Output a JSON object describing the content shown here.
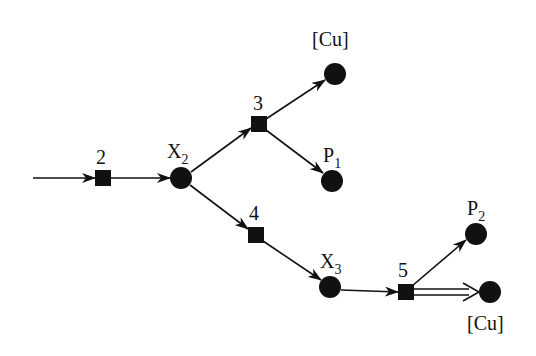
{
  "diagram": {
    "type": "reaction-network",
    "colors": {
      "ink": "#111111",
      "background": "#ffffff"
    },
    "nodes": [
      {
        "id": "X2",
        "shape": "circle",
        "x": 181,
        "y": 178,
        "label": "X",
        "sub": "2",
        "label_x": 167,
        "label_y": 158
      },
      {
        "id": "Cu_top",
        "shape": "circle",
        "x": 335,
        "y": 74,
        "label": "[Cu]",
        "sub": "",
        "label_x": 312,
        "label_y": 46
      },
      {
        "id": "P1",
        "shape": "circle",
        "x": 332,
        "y": 181,
        "label": "P",
        "sub": "1",
        "label_x": 323,
        "label_y": 162
      },
      {
        "id": "X3",
        "shape": "circle",
        "x": 330,
        "y": 287,
        "label": "X",
        "sub": "3",
        "label_x": 320,
        "label_y": 268
      },
      {
        "id": "P2",
        "shape": "circle",
        "x": 476,
        "y": 234,
        "label": "P",
        "sub": "2",
        "label_x": 467,
        "label_y": 215
      },
      {
        "id": "Cu_bot",
        "shape": "circle",
        "x": 490,
        "y": 292,
        "label": "[Cu]",
        "sub": "",
        "label_x": 467,
        "label_y": 330
      }
    ],
    "steps": [
      {
        "id": "s2",
        "shape": "square",
        "x": 103,
        "y": 178,
        "label": "2",
        "label_x": 96,
        "label_y": 164
      },
      {
        "id": "s3",
        "shape": "square",
        "x": 259,
        "y": 124,
        "label": "3",
        "label_x": 253,
        "label_y": 110
      },
      {
        "id": "s4",
        "shape": "square",
        "x": 256,
        "y": 235,
        "label": "4",
        "label_x": 249,
        "label_y": 220
      },
      {
        "id": "s5",
        "shape": "square",
        "x": 406,
        "y": 292,
        "label": "5",
        "label_x": 398,
        "label_y": 277
      }
    ],
    "edges": [
      {
        "from": [
          33,
          178
        ],
        "to": [
          95,
          178
        ],
        "style": "single"
      },
      {
        "from": [
          111,
          178
        ],
        "to": [
          170,
          178
        ],
        "style": "single"
      },
      {
        "from": [
          191,
          172
        ],
        "to": [
          251,
          128
        ],
        "style": "single"
      },
      {
        "from": [
          266,
          119
        ],
        "to": [
          325,
          80
        ],
        "style": "single"
      },
      {
        "from": [
          266,
          130
        ],
        "to": [
          323,
          173
        ],
        "style": "single"
      },
      {
        "from": [
          190,
          185
        ],
        "to": [
          248,
          229
        ],
        "style": "single"
      },
      {
        "from": [
          263,
          241
        ],
        "to": [
          321,
          280
        ],
        "style": "single"
      },
      {
        "from": [
          341,
          290
        ],
        "to": [
          398,
          292
        ],
        "style": "single"
      },
      {
        "from": [
          412,
          286
        ],
        "to": [
          466,
          240
        ],
        "style": "single"
      },
      {
        "from": [
          414,
          292
        ],
        "to": [
          479,
          292
        ],
        "style": "double"
      }
    ]
  }
}
